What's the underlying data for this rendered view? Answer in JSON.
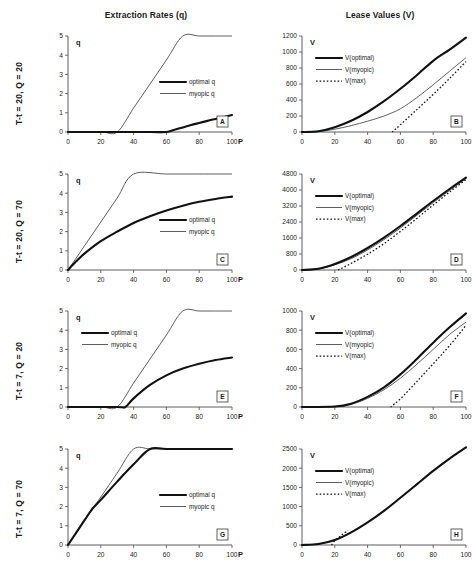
{
  "figure": {
    "columns": [
      {
        "id": "extraction",
        "title": "Extraction Rates (q)"
      },
      {
        "id": "lease",
        "title": "Lease Values (V)"
      }
    ],
    "rows": [
      {
        "id": "r1",
        "label": "T-t = 20, Q = 20"
      },
      {
        "id": "r2",
        "label": "T-t = 20, Q = 70"
      },
      {
        "id": "r3",
        "label": "T-t = 7, Q = 20"
      },
      {
        "id": "r4",
        "label": "T-t = 7, Q = 70"
      }
    ],
    "x_axis_name": "P",
    "left_axis_name_q": "q",
    "left_axis_name_v": "V"
  },
  "chart_data": [
    {
      "panel": "A",
      "type": "line",
      "title": "Extraction Rates (q)",
      "row": "T-t = 20, Q = 20",
      "xlabel": "P",
      "ylabel": "q",
      "xlim": [
        0,
        100
      ],
      "ylim": [
        0,
        5
      ],
      "xticks": [
        0,
        20,
        40,
        60,
        80,
        100
      ],
      "yticks": [
        0,
        1,
        2,
        3,
        4,
        5
      ],
      "grid": false,
      "legend": [
        "optimal q",
        "myopic q"
      ],
      "legend_position": "right-middle",
      "series": [
        {
          "name": "optimal q",
          "style": "thick",
          "x": [
            0,
            30,
            50,
            60,
            65,
            70,
            75,
            80,
            85,
            90,
            95,
            100
          ],
          "y": [
            0,
            0,
            0,
            0,
            0.12,
            0.24,
            0.36,
            0.47,
            0.58,
            0.68,
            0.78,
            0.88
          ]
        },
        {
          "name": "myopic q",
          "style": "thin",
          "x": [
            0,
            20,
            30,
            40,
            50,
            60,
            70,
            80,
            90,
            100
          ],
          "y": [
            0,
            0,
            0,
            1.25,
            2.5,
            3.75,
            5,
            5,
            5,
            5
          ]
        }
      ]
    },
    {
      "panel": "B",
      "type": "line",
      "title": "Lease Values (V)",
      "row": "T-t = 20, Q = 20",
      "xlabel": "P",
      "ylabel": "V",
      "xlim": [
        0,
        100
      ],
      "ylim": [
        0,
        1200
      ],
      "xticks": [
        0,
        20,
        40,
        60,
        80,
        100
      ],
      "yticks": [
        0,
        200,
        400,
        600,
        800,
        1000,
        1200
      ],
      "grid": false,
      "legend": [
        "V(optimal)",
        "V(myopic)",
        "V(max)"
      ],
      "legend_position": "upper-left",
      "series": [
        {
          "name": "V(optimal)",
          "style": "thick",
          "x": [
            0,
            10,
            20,
            30,
            40,
            50,
            60,
            70,
            80,
            90,
            100
          ],
          "y": [
            0,
            10,
            60,
            140,
            250,
            385,
            540,
            710,
            890,
            1030,
            1180
          ]
        },
        {
          "name": "V(myopic)",
          "style": "thin",
          "x": [
            0,
            10,
            20,
            30,
            40,
            50,
            60,
            70,
            80,
            90,
            100
          ],
          "y": [
            0,
            5,
            35,
            80,
            135,
            200,
            290,
            430,
            590,
            760,
            930
          ]
        },
        {
          "name": "V(max)",
          "style": "dotted",
          "x": [
            55,
            60,
            70,
            80,
            90,
            100
          ],
          "y": [
            0,
            90,
            280,
            470,
            670,
            880
          ]
        }
      ]
    },
    {
      "panel": "C",
      "type": "line",
      "title": "Extraction Rates (q)",
      "row": "T-t = 20, Q = 70",
      "xlabel": "P",
      "ylabel": "q",
      "xlim": [
        0,
        100
      ],
      "ylim": [
        0,
        5
      ],
      "xticks": [
        0,
        20,
        40,
        60,
        80,
        100
      ],
      "yticks": [
        0,
        1,
        2,
        3,
        4,
        5
      ],
      "grid": false,
      "legend": [
        "optimal q",
        "myopic q"
      ],
      "legend_position": "right-middle",
      "series": [
        {
          "name": "optimal q",
          "style": "thick",
          "x": [
            0,
            5,
            10,
            20,
            30,
            40,
            50,
            60,
            70,
            80,
            90,
            100
          ],
          "y": [
            0,
            0.45,
            0.85,
            1.5,
            2.0,
            2.45,
            2.8,
            3.1,
            3.35,
            3.55,
            3.7,
            3.82
          ]
        },
        {
          "name": "myopic q",
          "style": "thin",
          "x": [
            0,
            10,
            20,
            30,
            40,
            60,
            80,
            100
          ],
          "y": [
            0,
            1.25,
            2.5,
            3.75,
            5,
            5,
            5,
            5
          ]
        }
      ]
    },
    {
      "panel": "D",
      "type": "line",
      "title": "Lease Values (V)",
      "row": "T-t = 20, Q = 70",
      "xlabel": "P",
      "ylabel": "V",
      "xlim": [
        0,
        100
      ],
      "ylim": [
        0,
        4800
      ],
      "xticks": [
        0,
        20,
        40,
        60,
        80,
        100
      ],
      "yticks": [
        0,
        800,
        1600,
        2400,
        3200,
        4000,
        4800
      ],
      "grid": false,
      "legend": [
        "V(optimal)",
        "V(myopic)",
        "V(max)"
      ],
      "legend_position": "upper-left",
      "series": [
        {
          "name": "V(optimal)",
          "style": "thick",
          "x": [
            0,
            10,
            20,
            30,
            40,
            50,
            60,
            70,
            80,
            90,
            100
          ],
          "y": [
            0,
            60,
            300,
            650,
            1100,
            1620,
            2200,
            2820,
            3450,
            4050,
            4620
          ]
        },
        {
          "name": "V(myopic)",
          "style": "thin",
          "x": [
            0,
            10,
            20,
            30,
            40,
            50,
            60,
            70,
            80,
            90,
            100
          ],
          "y": [
            0,
            50,
            260,
            570,
            1000,
            1520,
            2100,
            2730,
            3370,
            3980,
            4570
          ]
        },
        {
          "name": "V(max)",
          "style": "dotted",
          "x": [
            22,
            30,
            40,
            50,
            60,
            70,
            80,
            90,
            100
          ],
          "y": [
            0,
            330,
            790,
            1320,
            1930,
            2580,
            3250,
            3900,
            4520
          ]
        }
      ]
    },
    {
      "panel": "E",
      "type": "line",
      "title": "Extraction Rates (q)",
      "row": "T-t = 7, Q = 20",
      "xlabel": "P",
      "ylabel": "q",
      "xlim": [
        0,
        100
      ],
      "ylim": [
        0,
        5
      ],
      "xticks": [
        0,
        20,
        40,
        60,
        80,
        100
      ],
      "yticks": [
        0,
        1,
        2,
        3,
        4,
        5
      ],
      "grid": false,
      "legend": [
        "optimal q",
        "myopic q"
      ],
      "legend_position": "upper-left",
      "series": [
        {
          "name": "optimal q",
          "style": "thick",
          "x": [
            0,
            30,
            35,
            40,
            50,
            60,
            70,
            80,
            90,
            100
          ],
          "y": [
            0,
            0,
            0,
            0.45,
            1.15,
            1.65,
            2.0,
            2.25,
            2.45,
            2.58
          ]
        },
        {
          "name": "myopic q",
          "style": "thin",
          "x": [
            0,
            20,
            30,
            40,
            50,
            60,
            70,
            80,
            90,
            100
          ],
          "y": [
            0,
            0,
            0,
            1.25,
            2.5,
            3.75,
            5,
            5,
            5,
            5
          ]
        }
      ]
    },
    {
      "panel": "F",
      "type": "line",
      "title": "Lease Values (V)",
      "row": "T-t = 7, Q = 20",
      "xlabel": "P",
      "ylabel": "V",
      "xlim": [
        0,
        100
      ],
      "ylim": [
        0,
        1000
      ],
      "xticks": [
        0,
        20,
        40,
        60,
        80,
        100
      ],
      "yticks": [
        0,
        200,
        400,
        600,
        800,
        1000
      ],
      "grid": false,
      "legend": [
        "V(optimal)",
        "V(myopic)",
        "V(max)"
      ],
      "legend_position": "upper-left",
      "series": [
        {
          "name": "V(optimal)",
          "style": "thick",
          "x": [
            0,
            20,
            30,
            40,
            50,
            60,
            70,
            80,
            90,
            100
          ],
          "y": [
            0,
            5,
            35,
            105,
            205,
            340,
            500,
            670,
            830,
            975
          ]
        },
        {
          "name": "V(myopic)",
          "style": "thin",
          "x": [
            0,
            20,
            30,
            40,
            50,
            60,
            70,
            80,
            90,
            100
          ],
          "y": [
            0,
            3,
            28,
            90,
            180,
            300,
            445,
            600,
            755,
            885
          ]
        },
        {
          "name": "V(max)",
          "style": "dotted",
          "x": [
            54,
            60,
            70,
            80,
            90,
            100
          ],
          "y": [
            0,
            85,
            265,
            450,
            640,
            850
          ]
        }
      ]
    },
    {
      "panel": "G",
      "type": "line",
      "title": "Extraction Rates (q)",
      "row": "T-t = 7, Q = 70",
      "xlabel": "P",
      "ylabel": "q",
      "xlim": [
        0,
        100
      ],
      "ylim": [
        0,
        5
      ],
      "xticks": [
        0,
        20,
        40,
        60,
        80,
        100
      ],
      "yticks": [
        0,
        1,
        2,
        3,
        4,
        5
      ],
      "grid": false,
      "legend": [
        "optimal q",
        "myopic q"
      ],
      "legend_position": "right-middle",
      "series": [
        {
          "name": "optimal q",
          "style": "thick",
          "x": [
            0,
            10,
            15,
            20,
            30,
            40,
            50,
            60,
            80,
            100
          ],
          "y": [
            0,
            1.28,
            1.9,
            2.35,
            3.3,
            4.2,
            5,
            5,
            5,
            5
          ]
        },
        {
          "name": "myopic q",
          "style": "thin",
          "x": [
            0,
            10,
            15,
            20,
            30,
            40,
            50,
            60,
            80,
            100
          ],
          "y": [
            0,
            1.25,
            1.9,
            2.5,
            3.75,
            5,
            5,
            5,
            5,
            5
          ]
        }
      ]
    },
    {
      "panel": "H",
      "type": "line",
      "title": "Lease Values (V)",
      "row": "T-t = 7, Q = 70",
      "xlabel": "P",
      "ylabel": "V",
      "xlim": [
        0,
        100
      ],
      "ylim": [
        0,
        2500
      ],
      "xticks": [
        0,
        20,
        40,
        60,
        80,
        100
      ],
      "yticks": [
        0,
        500,
        1000,
        1500,
        2000,
        2500
      ],
      "grid": false,
      "legend": [
        "V(optimal)",
        "V(myopic)",
        "V(max)"
      ],
      "legend_position": "upper-left",
      "series": [
        {
          "name": "V(optimal)",
          "style": "thick",
          "x": [
            0,
            10,
            20,
            30,
            40,
            50,
            60,
            70,
            80,
            90,
            100
          ],
          "y": [
            0,
            25,
            130,
            330,
            590,
            890,
            1230,
            1580,
            1930,
            2250,
            2540
          ]
        },
        {
          "name": "V(myopic)",
          "style": "thin",
          "x": [
            0,
            10,
            20,
            30,
            40,
            50,
            60,
            70,
            80,
            90,
            100
          ],
          "y": [
            0,
            25,
            130,
            330,
            590,
            890,
            1230,
            1580,
            1930,
            2250,
            2540
          ]
        },
        {
          "name": "V(max)",
          "style": "dotted",
          "x": [
            18,
            20,
            24,
            28
          ],
          "y": [
            0,
            110,
            250,
            380
          ]
        }
      ]
    }
  ],
  "colors": {
    "thick": "#111111",
    "thin": "#555555",
    "dotted": "#111111",
    "axis": "#4a4a4a"
  }
}
